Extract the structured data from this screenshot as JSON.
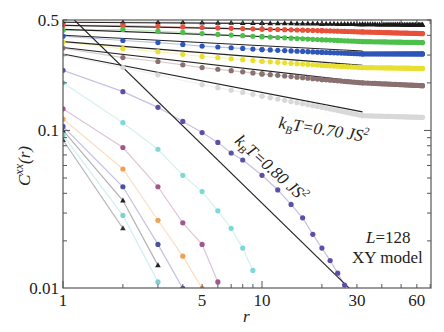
{
  "chart_data": {
    "type": "line",
    "scale": {
      "x": "log",
      "y": "log"
    },
    "title": "",
    "xlabel": "r",
    "ylabel": "C^xx(r)",
    "xlim": [
      1,
      71
    ],
    "ylim": [
      0.01,
      0.5
    ],
    "x_ticks": [
      {
        "value": 1,
        "label": "1"
      },
      {
        "value": 5,
        "label": "5"
      },
      {
        "value": 10,
        "label": "10"
      },
      {
        "value": 30,
        "label": "30"
      },
      {
        "value": 60,
        "label": "60"
      }
    ],
    "y_ticks": [
      {
        "value": 0.5,
        "label": "0.5"
      },
      {
        "value": 0.1,
        "label": "0.1"
      },
      {
        "value": 0.01,
        "label": "0.01"
      }
    ],
    "grid": false,
    "legend": "none",
    "series": [
      {
        "name": "T1 (black triangles)",
        "color": "#1a1a1a",
        "marker": "triangle",
        "x": [
          1,
          2,
          3,
          4,
          5,
          10,
          20,
          32,
          64
        ],
        "y": [
          0.484,
          0.484,
          0.484,
          0.483,
          0.482,
          0.478,
          0.474,
          0.47,
          0.466
        ]
      },
      {
        "name": "T2 (red)",
        "color": "#e8503a",
        "marker": "circle",
        "x": [
          1,
          2,
          3,
          4,
          5,
          10,
          20,
          32,
          64
        ],
        "y": [
          0.462,
          0.462,
          0.456,
          0.452,
          0.448,
          0.438,
          0.428,
          0.42,
          0.41
        ]
      },
      {
        "name": "T3 (green)",
        "color": "#4cc04a",
        "marker": "circle",
        "x": [
          1,
          2,
          3,
          4,
          5,
          10,
          20,
          32,
          64
        ],
        "y": [
          0.43,
          0.436,
          0.425,
          0.417,
          0.41,
          0.392,
          0.375,
          0.365,
          0.36
        ]
      },
      {
        "name": "T4 (blue)",
        "color": "#2e55b8",
        "marker": "circle",
        "x": [
          1,
          2,
          3,
          4,
          5,
          10,
          20,
          32,
          64
        ],
        "y": [
          0.395,
          0.371,
          0.36,
          0.35,
          0.342,
          0.325,
          0.312,
          0.305,
          0.305
        ]
      },
      {
        "name": "T5 (yellow)",
        "color": "#e8e030",
        "marker": "circle",
        "x": [
          1,
          2,
          3,
          4,
          5,
          10,
          20,
          32,
          64
        ],
        "y": [
          0.362,
          0.329,
          0.315,
          0.303,
          0.294,
          0.274,
          0.258,
          0.25,
          0.247
        ]
      },
      {
        "name": "T6 (brown)",
        "color": "#8a7070",
        "marker": "circle",
        "x": [
          1,
          2,
          3,
          4,
          5,
          10,
          20,
          32,
          64
        ],
        "y": [
          0.332,
          0.289,
          0.273,
          0.26,
          0.25,
          0.228,
          0.21,
          0.2,
          0.192
        ]
      },
      {
        "name": "kBT=0.70 JS^2 (light gray)",
        "color": "#d8d8d8",
        "marker": "circle",
        "x": [
          1,
          2,
          3,
          5,
          10,
          20,
          32,
          64
        ],
        "y": [
          0.3,
          0.25,
          0.225,
          0.195,
          0.165,
          0.14,
          0.124,
          0.121
        ]
      },
      {
        "name": "kBT=0.80 JS^2 (purple)",
        "color": "#5a50a8",
        "marker": "circle",
        "x": [
          1,
          2,
          3,
          4,
          5,
          6,
          7,
          8,
          10,
          12,
          14,
          16,
          18,
          20,
          22,
          24,
          26
        ],
        "y": [
          0.24,
          0.176,
          0.14,
          0.114,
          0.097,
          0.084,
          0.072,
          0.065,
          0.052,
          0.042,
          0.034,
          0.028,
          0.022,
          0.018,
          0.015,
          0.0125,
          0.0105
        ]
      },
      {
        "name": "cyan (upper)",
        "color": "#7ed8d8",
        "marker": "circle",
        "x": [
          1,
          2,
          3,
          4,
          5,
          6,
          7,
          8,
          9
        ],
        "y": [
          0.2,
          0.112,
          0.076,
          0.052,
          0.041,
          0.031,
          0.024,
          0.018,
          0.013
        ]
      },
      {
        "name": "magenta",
        "color": "#a05890",
        "marker": "circle",
        "x": [
          1,
          2,
          3,
          4,
          5,
          6
        ],
        "y": [
          0.137,
          0.078,
          0.044,
          0.026,
          0.019,
          0.011
        ]
      },
      {
        "name": "orange",
        "color": "#f0a050",
        "marker": "circle",
        "x": [
          1,
          2,
          3,
          4,
          5
        ],
        "y": [
          0.118,
          0.057,
          0.027,
          0.016,
          0.01
        ]
      },
      {
        "name": "blue (lower)",
        "color": "#5050a0",
        "marker": "circle",
        "x": [
          1,
          2,
          3,
          4
        ],
        "y": [
          0.106,
          0.044,
          0.019,
          0.01
        ]
      },
      {
        "name": "black triangles (lower)",
        "color": "#222222",
        "marker": "triangle",
        "x": [
          1,
          2,
          3
        ],
        "y": [
          0.1,
          0.036,
          0.014
        ]
      },
      {
        "name": "cyan (lower)",
        "color": "#80d0d0",
        "marker": "circle",
        "x": [
          1,
          2,
          3
        ],
        "y": [
          0.093,
          0.029,
          0.011
        ]
      },
      {
        "name": "dark triangles (lowest)",
        "color": "#333333",
        "marker": "triangle",
        "x": [
          1,
          2
        ],
        "y": [
          0.087,
          0.024
        ]
      }
    ],
    "fit_lines": [
      {
        "color": "#222222",
        "x": [
          1,
          32
        ],
        "y": [
          0.484,
          0.47
        ]
      },
      {
        "color": "#222222",
        "x": [
          1,
          32
        ],
        "y": [
          0.462,
          0.425
        ]
      },
      {
        "color": "#222222",
        "x": [
          1,
          32
        ],
        "y": [
          0.436,
          0.372
        ]
      },
      {
        "color": "#222222",
        "x": [
          1,
          32
        ],
        "y": [
          0.4,
          0.318
        ]
      },
      {
        "color": "#222222",
        "x": [
          1,
          32
        ],
        "y": [
          0.365,
          0.258
        ]
      },
      {
        "color": "#222222",
        "x": [
          1,
          32
        ],
        "y": [
          0.335,
          0.203
        ]
      },
      {
        "color": "#222222",
        "x": [
          1,
          32
        ],
        "y": [
          0.305,
          0.131
        ]
      },
      {
        "color": "#222222",
        "x": [
          1.14,
          27.5
        ],
        "y": [
          0.5,
          0.01
        ]
      }
    ],
    "annotations": [
      {
        "text_main": "k",
        "sub": "B",
        "rest": "T=0.70 JS",
        "sup": "2",
        "x": 278,
        "y": 128,
        "rotate": 9
      },
      {
        "text_main": "k",
        "sub": "B",
        "rest": "T=0.80 JS",
        "sup": "2",
        "x": 234,
        "y": 140,
        "rotate": 42
      },
      {
        "line1": "L=128",
        "line2": "XY model"
      }
    ]
  }
}
